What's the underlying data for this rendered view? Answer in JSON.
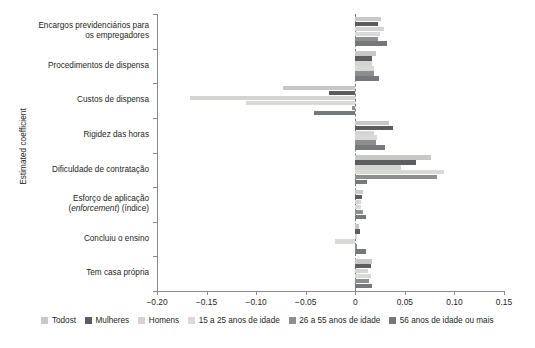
{
  "chart_data": {
    "type": "bar",
    "orientation": "horizontal",
    "title": "",
    "xlabel": "",
    "ylabel": "Estimated coefficient",
    "xlim": [
      -0.2,
      0.15
    ],
    "xticks": [
      -0.2,
      -0.15,
      -0.1,
      -0.05,
      0,
      0.05,
      0.1,
      0.15
    ],
    "xtick_labels": [
      "−0.20",
      "−0.15",
      "−0.10",
      "−0.05",
      "0",
      "0.05",
      "0.10",
      "0.15"
    ],
    "grid": false,
    "zero_reference_line": true,
    "legend_position": "bottom",
    "categories": [
      "Encargos previdenciários para os empregadores",
      "Procedimentos de dispensa",
      "Custos de dispensa",
      "Rigidez das horas",
      "Dificuldade de contratação",
      "Esforço de aplicação (enforcement) (índice)",
      "Concluiu o ensino",
      "Tem casa própria"
    ],
    "category_lines": [
      [
        "Encargos previdenciários para",
        "os empregadores"
      ],
      [
        "Procedimentos de dispensa"
      ],
      [
        "Custos de dispensa"
      ],
      [
        "Rigidez das horas"
      ],
      [
        "Dificuldade de contratação"
      ],
      [
        "Esforço de aplicação",
        "(enforcement) (índice)"
      ],
      [
        "Concluiu o ensino"
      ],
      [
        "Tem casa própria"
      ]
    ],
    "series": [
      {
        "name": "Todost",
        "color": "#c8c9c7",
        "values": [
          0.026,
          0.021,
          -0.073,
          0.034,
          0.076,
          0.008,
          0.004,
          0.017
        ]
      },
      {
        "name": "Mulheres",
        "color": "#5c5d5f",
        "values": [
          0.023,
          0.017,
          -0.027,
          0.038,
          0.061,
          0.007,
          0.005,
          0.016
        ]
      },
      {
        "name": "Homens",
        "color": "#d4d5d3",
        "values": [
          0.029,
          0.017,
          -0.167,
          0.019,
          0.046,
          0.006,
          0.002,
          0.013
        ]
      },
      {
        "name": "15 a 25 anos de idade",
        "color": "#d9dad7",
        "values": [
          0.025,
          0.019,
          -0.11,
          0.022,
          0.089,
          0.006,
          -0.02,
          0.016
        ]
      },
      {
        "name": "26 a 55 anos de idade",
        "color": "#8d8f8f",
        "values": [
          0.023,
          0.019,
          -0.003,
          0.021,
          0.082,
          0.008,
          0.002,
          0.014
        ]
      },
      {
        "name": "56 anos de idade ou mais",
        "color": "#76797b",
        "values": [
          0.032,
          0.024,
          -0.042,
          0.03,
          0.012,
          0.011,
          0.011,
          0.017
        ]
      }
    ]
  }
}
